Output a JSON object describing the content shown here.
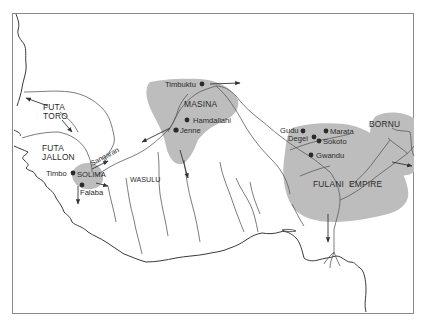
{
  "map": {
    "colors": {
      "background": "#ffffff",
      "frame": "#8a8a8a",
      "coast": "#3a3a3a",
      "river": "#5a5a5a",
      "shaded_region": "#bdbdbd",
      "text": "#2a2a2a",
      "town_dot": "#2a2a2a",
      "arrow": "#333333"
    },
    "regions": [
      {
        "id": "futa-toro",
        "line1": "FUTA",
        "line2": "TORO"
      },
      {
        "id": "futa-jallon",
        "line1": "FUTA",
        "line2": "JALLON"
      },
      {
        "id": "masina",
        "label": "MASINA"
      },
      {
        "id": "wasulu",
        "label": "WASULU"
      },
      {
        "id": "fulani-empire",
        "label": "FULANI  EMPIRE"
      },
      {
        "id": "bornu",
        "label": "BORNU"
      },
      {
        "id": "solima",
        "label": "SOLIMA"
      }
    ],
    "rivers": [
      {
        "id": "sangaran",
        "label": "Sangaran"
      }
    ],
    "towns": [
      {
        "id": "timbuktu",
        "label": "Timbuktu"
      },
      {
        "id": "hamdallahi",
        "label": "Hamdallahi"
      },
      {
        "id": "jenne",
        "label": "Jenne"
      },
      {
        "id": "timbo",
        "label": "Timbo"
      },
      {
        "id": "falaba",
        "label": "Falaba"
      },
      {
        "id": "gudu",
        "label": "Gudu"
      },
      {
        "id": "degel",
        "label": "Degel"
      },
      {
        "id": "marata",
        "label": "Marata"
      },
      {
        "id": "sokoto",
        "label": "Sokoto"
      },
      {
        "id": "gwandu",
        "label": "Gwandu"
      }
    ]
  }
}
